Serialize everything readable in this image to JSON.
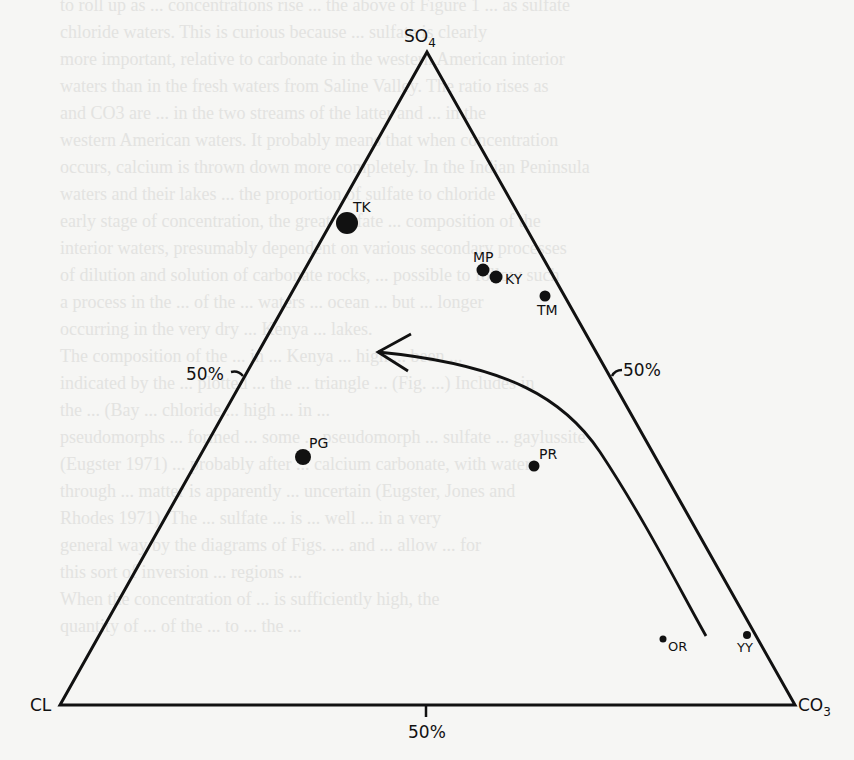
{
  "diagram": {
    "type": "ternary",
    "vertices": {
      "top": {
        "label": "SO",
        "subscript": "4"
      },
      "left": {
        "label": "CL",
        "subscript": ""
      },
      "right": {
        "label": "CO",
        "subscript": "3"
      }
    },
    "ticks": {
      "left_edge": "50%",
      "right_edge": "50%",
      "base": "50%"
    },
    "points": [
      {
        "label": "TK",
        "size": "large"
      },
      {
        "label": "MP",
        "size": "medium"
      },
      {
        "label": "KY",
        "size": "medium"
      },
      {
        "label": "TM",
        "size": "small"
      },
      {
        "label": "PG",
        "size": "medium"
      },
      {
        "label": "PR",
        "size": "small"
      },
      {
        "label": "OR",
        "size": "tiny"
      },
      {
        "label": "YY",
        "size": "tiny"
      }
    ],
    "arrow": {
      "description": "curved trend arrow from CO3 corner toward SO4/CL side"
    }
  },
  "background_text": [
    "to roll up as ... concentrations rise ... the above of Figure 1 ... as sulfate",
    "chloride waters. This is curious because ... sulfate is clearly",
    "more important, relative to carbonate in the western American interior",
    "waters than in the fresh waters from Saline Valley. The ratio rises as",
    "and CO3 are ... in the two streams of the latter and ... in the",
    "western American waters. It probably means that when concentration",
    "occurs, calcium is thrown down more completely. In the Indian Peninsula",
    "waters and their lakes ... the proportion of sulfate to chloride",
    "early stage of concentration, the great sulfate ... composition of the",
    "interior waters, presumably dependent on various secondary processes",
    "of dilution and solution of carbonate rocks, ... possible to follow such",
    "a process in the ... of the ... waters ... ocean ... but ... longer",
    "occurring in the very dry ... Kenya ... lakes.",
    "The composition of the ... in ... Kenya ... high ... been ... ",
    "indicated by the ... plotted ... the ... triangle ... (Fig. ...) Includes in",
    "the ... (Bay ... chloride ... high ... in ... ",
    "pseudomorphs ... formed ... some ... pseudomorph ... sulfate ... gaylussite",
    "(Eugster 1971) ... probably after ... calcium carbonate, with water",
    "through ... matter is apparently ... uncertain (Eugster, Jones and",
    "Rhodes 1971). The ... sulfate ... is ... well ... in a very",
    "general way by the diagrams of Figs. ... and ... allow ... for",
    "this sort of inversion ... regions ... ",
    "When the concentration of ... is sufficiently high, the",
    "quantity of ... of the ... to ... the ... "
  ]
}
